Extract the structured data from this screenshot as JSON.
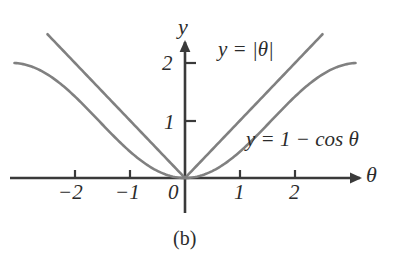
{
  "figure": {
    "caption": "(b)",
    "axis_color": "#3a3a3a",
    "curve_color": "#808080",
    "text_color": "#2b2b2b",
    "background": "#ffffff"
  },
  "axes": {
    "x_label": "θ",
    "y_label": "y",
    "x_ticks": [
      "−2",
      "−1",
      "0",
      "1",
      "2"
    ],
    "y_ticks": [
      "1",
      "2"
    ]
  },
  "curves": {
    "abs": {
      "label": "y = |θ|"
    },
    "cos": {
      "label": "y = 1 − cos θ"
    }
  },
  "chart_data": {
    "type": "line",
    "title": "",
    "subtitle": "(b)",
    "xlabel": "θ",
    "ylabel": "y",
    "xlim": [
      -3.2,
      3.2
    ],
    "ylim": [
      -0.35,
      2.45
    ],
    "xticks": [
      -2,
      -1,
      0,
      1,
      2
    ],
    "xticklabels": [
      "−2",
      "−1",
      "0",
      "1",
      "2"
    ],
    "yticks": [
      1,
      2
    ],
    "yticklabels": [
      "1",
      "2"
    ],
    "grid": false,
    "legend": "inline-annotations",
    "annotations": [
      {
        "text": "y = |θ|",
        "x": 0.6,
        "y": 2.3
      },
      {
        "text": "y = 1 − cos θ",
        "x": 1.1,
        "y": 0.85
      }
    ],
    "series": [
      {
        "name": "y = |θ|",
        "expression": "abs(theta)",
        "x": [
          -2.5,
          -2.25,
          -2,
          -1.75,
          -1.5,
          -1.25,
          -1,
          -0.75,
          -0.5,
          -0.25,
          0,
          0.25,
          0.5,
          0.75,
          1,
          1.25,
          1.5,
          1.75,
          2,
          2.25,
          2.5
        ],
        "values": [
          2.5,
          2.25,
          2,
          1.75,
          1.5,
          1.25,
          1,
          0.75,
          0.5,
          0.25,
          0,
          0.25,
          0.5,
          0.75,
          1,
          1.25,
          1.5,
          1.75,
          2,
          2.25,
          2.5
        ]
      },
      {
        "name": "y = 1 − cos θ",
        "expression": "1 - cos(theta)",
        "x": [
          -3.1,
          -2.8,
          -2.5,
          -2.25,
          -2,
          -1.75,
          -1.5,
          -1.25,
          -1,
          -0.75,
          -0.5,
          -0.25,
          0,
          0.25,
          0.5,
          0.75,
          1,
          1.25,
          1.5,
          1.75,
          2,
          2.25,
          2.5,
          2.8,
          3.1
        ],
        "values": [
          1.999,
          1.942,
          1.801,
          1.628,
          1.416,
          1.178,
          0.929,
          0.685,
          0.46,
          0.268,
          0.122,
          0.031,
          0,
          0.031,
          0.122,
          0.268,
          0.46,
          0.685,
          0.929,
          1.178,
          1.416,
          1.628,
          1.801,
          1.942,
          1.999
        ]
      }
    ]
  }
}
